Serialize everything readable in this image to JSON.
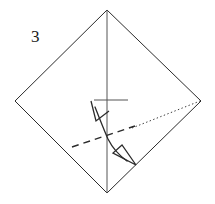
{
  "figure": {
    "type": "origami-fold-diagram",
    "step_number": "3",
    "canvas": {
      "width": 215,
      "height": 204
    },
    "background_color": "#ffffff",
    "line_color": "#2b2b2b",
    "guide_color": "#4a4a4a"
  },
  "step_label": {
    "text": "3",
    "x": 31,
    "y": 42
  },
  "paper": {
    "shape": "square-rotated-45",
    "name": "diamond-outline",
    "stroke": "#2b2b2b",
    "stroke_width": 1,
    "fill": "none",
    "vertices": [
      {
        "name": "top",
        "x": 107,
        "y": 10
      },
      {
        "name": "right",
        "x": 201,
        "y": 101
      },
      {
        "name": "bottom",
        "x": 107,
        "y": 193
      },
      {
        "name": "left",
        "x": 15,
        "y": 101
      }
    ],
    "points_attr": "107,10 201,101 107,193 15,101"
  },
  "creases": {
    "vertical_center": {
      "name": "vertical-crease-line",
      "x1": 107,
      "y1": 10,
      "x2": 107,
      "y2": 193,
      "stroke": "#555555",
      "stroke_width": 1,
      "style": "solid"
    },
    "horizontal_tick": {
      "name": "horizontal-crease-tick",
      "x1": 94,
      "y1": 100,
      "x2": 128,
      "y2": 100,
      "stroke": "#555555",
      "stroke_width": 1,
      "style": "solid"
    }
  },
  "fold_line": {
    "name": "dashed-fold-line",
    "style": "dashed",
    "x1": 72,
    "y1": 147,
    "x2": 135,
    "y2": 126,
    "stroke": "#2b2b2b",
    "stroke_width": 1.4,
    "dash_pattern": "7 5"
  },
  "reference_line": {
    "name": "dotted-reference-line",
    "style": "dotted",
    "x1": 132,
    "y1": 128,
    "x2": 200,
    "y2": 101,
    "stroke": "#3a3a3a",
    "stroke_width": 1,
    "dash_pattern": "1.4 2.4"
  },
  "fold_arrow": {
    "name": "double-headed-fold-arrow",
    "stroke": "#2b2b2b",
    "stroke_width": 1.3,
    "curve_path": "M 95 107 C 101 122 104 130 108 139 C 113 149 120 156 127 161",
    "head_up": {
      "name": "arrowhead-up-left",
      "style": "open-v",
      "points_attr": "91 101 96 121 109 111"
    },
    "head_down": {
      "name": "arrowhead-down-right",
      "style": "hollow-triangle",
      "points_attr": "136 165 113 153 122 145"
    }
  }
}
